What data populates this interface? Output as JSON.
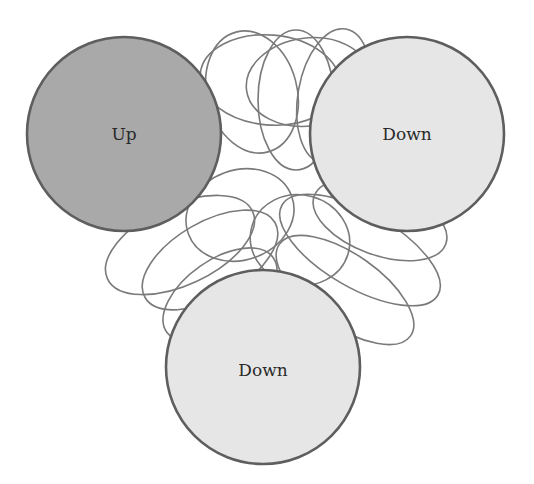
{
  "diagram": {
    "type": "state-loops",
    "colors": {
      "up_fill": "#a9a9a9",
      "down_fill": "#e6e6e6",
      "stroke": "#5e5e5e",
      "loop_stroke": "#7a7a7a"
    },
    "nodes": [
      {
        "id": "up",
        "label": "Up",
        "cx": 124,
        "cy": 134,
        "r": 97
      },
      {
        "id": "down-right",
        "label": "Down",
        "cx": 407,
        "cy": 134,
        "r": 97
      },
      {
        "id": "down-bottom",
        "label": "Down",
        "cx": 263,
        "cy": 367,
        "r": 97
      }
    ]
  }
}
